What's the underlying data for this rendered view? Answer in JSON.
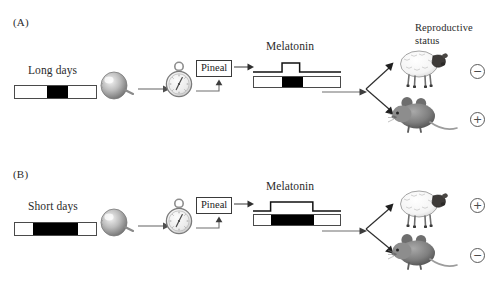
{
  "figure": {
    "title_hidden": "",
    "background": "#ffffff",
    "ink": "#2b2b2b"
  },
  "legend": {
    "reproductive_status_line1": "Reproductive",
    "reproductive_status_line2": "status"
  },
  "panels": [
    {
      "id": "A",
      "label": "(A)",
      "photoperiod_label": "Long days",
      "photoperiod": {
        "day_before_pct": 40,
        "night_pct": 26,
        "day_after_pct": 34,
        "night_color": "#000000",
        "day_color": "#ffffff"
      },
      "eye_icon": "eyeball-icon",
      "clock_icon": "pocket-watch-icon",
      "pineal_label": "Pineal",
      "melatonin_label": "Melatonin",
      "melatonin_profile": {
        "pulse_start_pct": 33,
        "pulse_width_pct": 20,
        "pulse_height_px": 9,
        "description": "short-duration nocturnal melatonin pulse"
      },
      "melatonin_photoperiod": {
        "day_before_pct": 33,
        "night_pct": 24,
        "day_after_pct": 43
      },
      "outcomes": [
        {
          "animal": "sheep",
          "animal_icon": "sheep-icon",
          "status_symbol": "−",
          "status_name": "minus-circle-icon",
          "meaning": "reproductively inhibited"
        },
        {
          "animal": "mouse",
          "animal_icon": "mouse-icon",
          "status_symbol": "+",
          "status_name": "plus-circle-icon",
          "meaning": "reproductively active"
        }
      ]
    },
    {
      "id": "B",
      "label": "(B)",
      "photoperiod_label": "Short days",
      "photoperiod": {
        "day_before_pct": 22,
        "night_pct": 56,
        "day_after_pct": 22,
        "night_color": "#000000",
        "day_color": "#ffffff"
      },
      "eye_icon": "eyeball-icon",
      "clock_icon": "pocket-watch-icon",
      "pineal_label": "Pineal",
      "melatonin_label": "Melatonin",
      "melatonin_profile": {
        "pulse_start_pct": 20,
        "pulse_width_pct": 48,
        "pulse_height_px": 9,
        "description": "long-duration nocturnal melatonin pulse"
      },
      "melatonin_photoperiod": {
        "day_before_pct": 20,
        "night_pct": 50,
        "day_after_pct": 30
      },
      "outcomes": [
        {
          "animal": "sheep",
          "animal_icon": "sheep-icon",
          "status_symbol": "+",
          "status_name": "plus-circle-icon",
          "meaning": "reproductively active"
        },
        {
          "animal": "mouse",
          "animal_icon": "mouse-icon",
          "status_symbol": "−",
          "status_name": "minus-circle-icon",
          "meaning": "reproductively inhibited"
        }
      ]
    }
  ]
}
